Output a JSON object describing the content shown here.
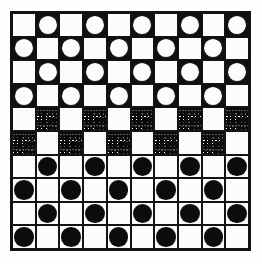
{
  "figure": {
    "width": 262,
    "height": 264
  },
  "board": {
    "rows": 10,
    "columns": 10,
    "border_color": "#111111",
    "light_square_color": "#fcfcfc",
    "dark_square_color": "#101010",
    "disc_light_color": "#fcfcfc",
    "disc_dark_color": "#0c0c0c",
    "stipple_color": "#0a0a0a"
  },
  "legend": {
    "light_label": "light square",
    "white_disc_label": "white disc on dark square",
    "stipple_label": "stippled square",
    "black_disc_label": "black disc on light square"
  },
  "chart_data": {
    "type": "heatmap",
    "xlabel": "",
    "ylabel": "",
    "categories": [
      "1",
      "2",
      "3",
      "4",
      "5",
      "6",
      "7",
      "8",
      "9",
      "10"
    ],
    "row_labels": [
      "1",
      "2",
      "3",
      "4",
      "5",
      "6",
      "7",
      "8",
      "9",
      "10"
    ],
    "cell_types": [
      "light",
      "dark-white-disc",
      "stipple",
      "light-black-disc"
    ],
    "grid": [
      [
        "light",
        "dark-white-disc",
        "light",
        "dark-white-disc",
        "light",
        "dark-white-disc",
        "light",
        "dark-white-disc",
        "light",
        "dark-white-disc"
      ],
      [
        "dark-white-disc",
        "light",
        "dark-white-disc",
        "light",
        "dark-white-disc",
        "light",
        "dark-white-disc",
        "light",
        "dark-white-disc",
        "light"
      ],
      [
        "light",
        "dark-white-disc",
        "light",
        "dark-white-disc",
        "light",
        "dark-white-disc",
        "light",
        "dark-white-disc",
        "light",
        "dark-white-disc"
      ],
      [
        "dark-white-disc",
        "light",
        "dark-white-disc",
        "light",
        "dark-white-disc",
        "light",
        "dark-white-disc",
        "light",
        "dark-white-disc",
        "light"
      ],
      [
        "light",
        "stipple",
        "light",
        "stipple",
        "light",
        "stipple",
        "light",
        "stipple",
        "light",
        "stipple"
      ],
      [
        "stipple",
        "light",
        "stipple",
        "light",
        "stipple",
        "light",
        "stipple",
        "light",
        "stipple",
        "light"
      ],
      [
        "light",
        "light-black-disc",
        "light",
        "light-black-disc",
        "light",
        "light-black-disc",
        "light",
        "light-black-disc",
        "light",
        "light-black-disc"
      ],
      [
        "light-black-disc",
        "light",
        "light-black-disc",
        "light",
        "light-black-disc",
        "light",
        "light-black-disc",
        "light",
        "light-black-disc",
        "light"
      ],
      [
        "light",
        "light-black-disc",
        "light",
        "light-black-disc",
        "light",
        "light-black-disc",
        "light",
        "light-black-disc",
        "light",
        "light-black-disc"
      ],
      [
        "light-black-disc",
        "light",
        "light-black-disc",
        "light",
        "light-black-disc",
        "light",
        "light-black-disc",
        "light",
        "light-black-disc",
        "light"
      ]
    ]
  }
}
